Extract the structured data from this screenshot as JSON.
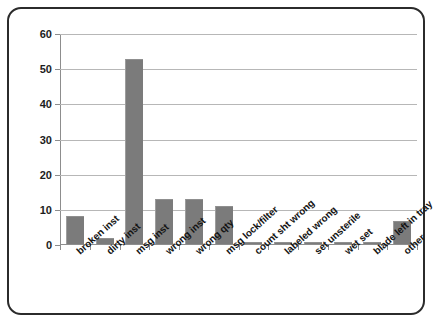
{
  "chart_data": {
    "type": "bar",
    "title": "",
    "subtitle": "",
    "xlabel": "",
    "ylabel": "",
    "ylim": [
      0,
      60
    ],
    "yticks": [
      0,
      10,
      20,
      30,
      40,
      50,
      60
    ],
    "grid": true,
    "legend": false,
    "legend_position": "none",
    "bar_color": "#7b7b7b",
    "categories": [
      "broken inst",
      "dirty inst",
      "msg inst",
      "wrong inst",
      "wrong qty",
      "msg lock/filter",
      "count sht wrong",
      "labeled wrong",
      "set unsterile",
      "wet set",
      "blade left in tray",
      "other"
    ],
    "values": [
      8,
      1.8,
      52.6,
      12.7,
      12.7,
      10.7,
      0.6,
      0.6,
      0.6,
      0.6,
      0.6,
      6.5
    ]
  }
}
